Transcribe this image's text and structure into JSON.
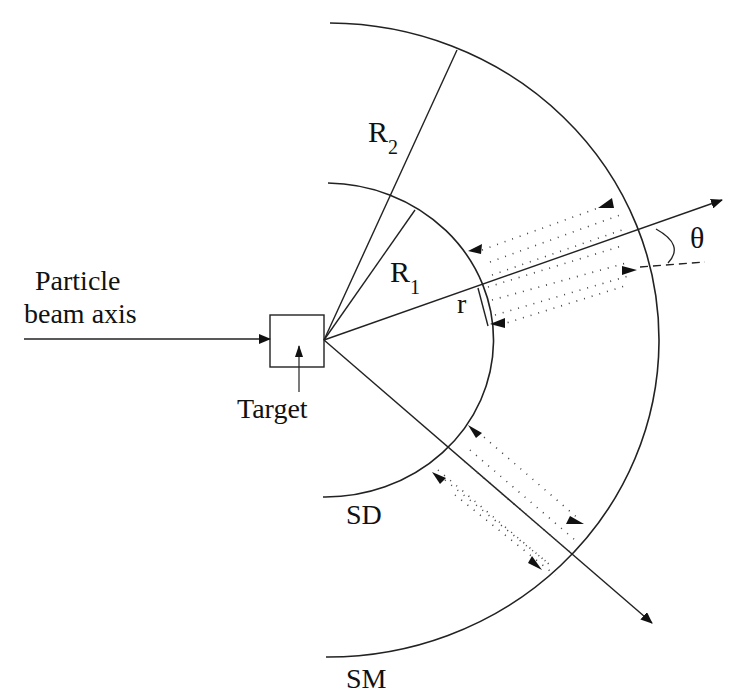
{
  "diagram": {
    "labels": {
      "beam_line1": "Particle",
      "beam_line2": "beam axis",
      "target": "Target",
      "r2_main": "R",
      "r2_sub": "2",
      "r1_main": "R",
      "r1_sub": "1",
      "r": "r",
      "theta": "θ",
      "sd": "SD",
      "sm": "SM"
    },
    "elements": {
      "inner_arc": "SD (inner spherical detector arc)",
      "outer_arc": "SM (outer spherical arc)",
      "target_box": "Target",
      "beam_axis": "Particle beam axis arrow",
      "ray_theta": "Ray at angle theta",
      "ray_lower": "Lower ray",
      "radius_r2": "Radius R2",
      "radius_r1": "Radius R1",
      "dotted_paths": "Dotted particle trajectories between SD and SM"
    },
    "colors": {
      "stroke": "#222222",
      "background": "#ffffff"
    }
  }
}
